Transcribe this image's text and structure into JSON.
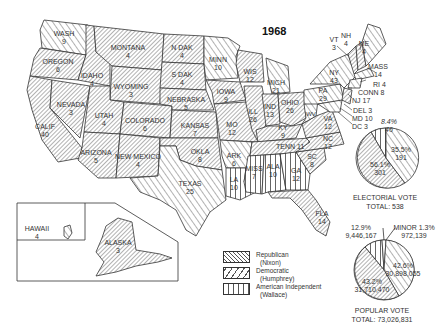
{
  "title": "1968",
  "colors": {
    "ink": "#333333",
    "background": "#ffffff"
  },
  "legend": [
    {
      "party": "Republican",
      "candidate": "(Nixon)",
      "pattern": "fine-diagonal-hatch"
    },
    {
      "party": "Democratic",
      "candidate": "(Humphrey)",
      "pattern": "wide-diagonal-hatch"
    },
    {
      "party": "American Independent",
      "candidate": "(Wallace)",
      "pattern": "vertical-lines"
    }
  ],
  "states": [
    {
      "name": "WASH",
      "votes": "9",
      "party": "Democratic"
    },
    {
      "name": "OREGON",
      "votes": "6",
      "party": "Republican"
    },
    {
      "name": "CALIF",
      "votes": "40",
      "party": "Republican"
    },
    {
      "name": "NEVADA",
      "votes": "3",
      "party": "Republican"
    },
    {
      "name": "IDAHO",
      "votes": "4",
      "party": "Republican"
    },
    {
      "name": "MONTANA",
      "votes": "4",
      "party": "Republican"
    },
    {
      "name": "WYOMING",
      "votes": "3",
      "party": "Republican"
    },
    {
      "name": "UTAH",
      "votes": "4",
      "party": "Republican"
    },
    {
      "name": "ARIZONA",
      "votes": "5",
      "party": "Republican"
    },
    {
      "name": "COLORADO",
      "votes": "6",
      "party": "Republican"
    },
    {
      "name": "NEW MEXICO",
      "votes": "4",
      "party": "Republican"
    },
    {
      "name": "N DAK",
      "votes": "4",
      "party": "Republican"
    },
    {
      "name": "S DAK",
      "votes": "4",
      "party": "Republican"
    },
    {
      "name": "NEBRASKA",
      "votes": "5",
      "party": "Republican"
    },
    {
      "name": "KANSAS",
      "votes": "7",
      "party": "Republican"
    },
    {
      "name": "OKLA",
      "votes": "8",
      "party": "Republican"
    },
    {
      "name": "TEXAS",
      "votes": "25",
      "party": "Democratic"
    },
    {
      "name": "MINN",
      "votes": "10",
      "party": "Democratic"
    },
    {
      "name": "IOWA",
      "votes": "9",
      "party": "Republican"
    },
    {
      "name": "MO",
      "votes": "12",
      "party": "Republican"
    },
    {
      "name": "ARK",
      "votes": "6",
      "party": "American Independent"
    },
    {
      "name": "LA",
      "votes": "10",
      "party": "American Independent"
    },
    {
      "name": "WIS",
      "votes": "12",
      "party": "Republican"
    },
    {
      "name": "ILL",
      "votes": "26",
      "party": "Republican"
    },
    {
      "name": "MICH",
      "votes": "21",
      "party": "Democratic"
    },
    {
      "name": "IND",
      "votes": "13",
      "party": "Republican"
    },
    {
      "name": "OHIO",
      "votes": "26",
      "party": "Republican"
    },
    {
      "name": "KY",
      "votes": "9",
      "party": "Republican"
    },
    {
      "name": "TENN",
      "votes": "11",
      "party": "Republican"
    },
    {
      "name": "MISS",
      "votes": "7",
      "party": "American Independent"
    },
    {
      "name": "ALA",
      "votes": "10",
      "party": "American Independent"
    },
    {
      "name": "GA",
      "votes": "12",
      "party": "American Independent"
    },
    {
      "name": "FLA",
      "votes": "14",
      "party": "Republican"
    },
    {
      "name": "SC",
      "votes": "8",
      "party": "Republican"
    },
    {
      "name": "NC",
      "votes": "12",
      "party": "Republican"
    },
    {
      "name": "VA",
      "votes": "12",
      "party": "Republican"
    },
    {
      "name": "WV",
      "votes": "7",
      "party": "Democratic"
    },
    {
      "name": "PA",
      "votes": "29",
      "party": "Democratic"
    },
    {
      "name": "NY",
      "votes": "43",
      "party": "Democratic"
    },
    {
      "name": "VT",
      "votes": "3",
      "party": "Republican"
    },
    {
      "name": "NH",
      "votes": "4",
      "party": "Republican"
    },
    {
      "name": "ME",
      "votes": "4",
      "party": "Democratic"
    },
    {
      "name": "MASS",
      "votes": "14",
      "party": "Democratic"
    },
    {
      "name": "RI",
      "votes": "4",
      "party": "Democratic"
    },
    {
      "name": "CONN",
      "votes": "8",
      "party": "Democratic"
    },
    {
      "name": "NJ",
      "votes": "17",
      "party": "Republican"
    },
    {
      "name": "DEL",
      "votes": "3",
      "party": "Republican"
    },
    {
      "name": "MD",
      "votes": "10",
      "party": "Democratic"
    },
    {
      "name": "DC",
      "votes": "3",
      "party": "Democratic"
    },
    {
      "name": "HAWAII",
      "votes": "4",
      "party": "Democratic"
    },
    {
      "name": "ALASKA",
      "votes": "3",
      "party": "Republican"
    }
  ],
  "callouts": {
    "vt": "VT",
    "vt_v": "3",
    "nh": "NH",
    "nh_v": "4",
    "me": "ME",
    "me_v": "4",
    "mass": "MASS",
    "mass_v": "14",
    "ri": "RI 4",
    "conn": "CONN 8",
    "nj": "NJ 17",
    "del": "DEL 3",
    "md": "MD 10",
    "dc": "DC 3"
  },
  "electoral_pie": {
    "caption_line1": "ELECTORIAL VOTE",
    "caption_line2": "TOTAL:  538",
    "slices": [
      {
        "party": "American Independent",
        "pct": "8.4%",
        "value": "46"
      },
      {
        "party": "Democratic",
        "pct": "35.5%",
        "value": "191"
      },
      {
        "party": "Republican",
        "pct": "56.1%",
        "value": "301"
      }
    ]
  },
  "popular_pie": {
    "caption_line1": "POPULAR VOTE",
    "caption_line2": "TOTAL:  73,026,831",
    "slices": [
      {
        "party": "American Independent",
        "pct": "12.9%",
        "value": "9,446,167"
      },
      {
        "party": "Minor",
        "pct": "MINOR 1.3%",
        "value": "972,139"
      },
      {
        "party": "Democratic",
        "pct": "42.6%",
        "value": "30,898,055"
      },
      {
        "party": "Republican",
        "pct": "43.2%",
        "value": "31,710,470"
      }
    ]
  }
}
